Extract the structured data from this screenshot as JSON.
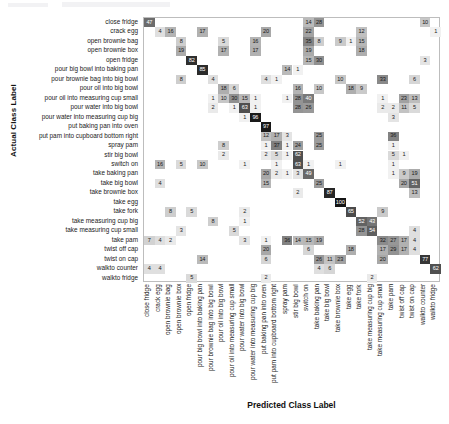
{
  "figure": {
    "x_axis_title": "Predicted Class Label",
    "y_axis_title": "Actual Class Label"
  },
  "chart_data": {
    "type": "heatmap",
    "subtype": "confusion-matrix",
    "title": "",
    "xlabel": "Predicted Class Label",
    "ylabel": "Actual Class Label",
    "grid": false,
    "legend": "none",
    "normalized": "percent",
    "value_range": [
      0,
      100
    ],
    "colormap": "greys",
    "categories": [
      "close fridge",
      "crack egg",
      "open brownie bag",
      "open brownie box",
      "open fridge",
      "pour big bowl into baking pan",
      "pour brownie bag into big bowl",
      "pour oil into big bowl",
      "pour oil into measuring cup small",
      "pour water into big bowl",
      "pour water into measuring cup big",
      "put baking pan into oven",
      "put pam into cupboard bottom right",
      "spray pam",
      "stir big bowl",
      "switch on",
      "take baking pan",
      "take big bowl",
      "take brownie box",
      "take egg",
      "take fork",
      "take measuring cup big",
      "take measuring cup small",
      "take pam",
      "twist off cap",
      "twist on cap",
      "walkto counter",
      "walkto fridge"
    ],
    "x_categories": [
      "close fridge",
      "crack egg",
      "open brownie bag",
      "open brownie box",
      "open fridge",
      "pour big bowl into baking pan",
      "pour brownie bag into big bowl",
      "pour oil into big bowl",
      "pour oil into measuring cup small",
      "pour water into big bowl",
      "pour water into measuring cup big",
      "put baking pan into oven",
      "put pam into cupboard bottom right",
      "spray pam",
      "stir big bowl",
      "switch on",
      "take baking pan",
      "take big bowl",
      "take brownie box",
      "take egg",
      "take fork",
      "take measuring cup big",
      "take measuring cup small",
      "take pam",
      "twist off cap",
      "twist on cap",
      "walkto counter",
      "walkto fridge"
    ],
    "cells": [
      {
        "r": 0,
        "c": 0,
        "v": 47
      },
      {
        "r": 0,
        "c": 15,
        "v": 14
      },
      {
        "r": 0,
        "c": 16,
        "v": 28
      },
      {
        "r": 0,
        "c": 26,
        "v": 10
      },
      {
        "r": 1,
        "c": 1,
        "v": 4
      },
      {
        "r": 1,
        "c": 2,
        "v": 16
      },
      {
        "r": 1,
        "c": 5,
        "v": 17
      },
      {
        "r": 1,
        "c": 11,
        "v": 20
      },
      {
        "r": 1,
        "c": 15,
        "v": 22
      },
      {
        "r": 1,
        "c": 20,
        "v": 12
      },
      {
        "r": 1,
        "c": 27,
        "v": 1
      },
      {
        "r": 2,
        "c": 3,
        "v": 8
      },
      {
        "r": 2,
        "c": 7,
        "v": 5
      },
      {
        "r": 2,
        "c": 10,
        "v": 16
      },
      {
        "r": 2,
        "c": 15,
        "v": 35
      },
      {
        "r": 2,
        "c": 16,
        "v": 8
      },
      {
        "r": 2,
        "c": 18,
        "v": 9
      },
      {
        "r": 2,
        "c": 19,
        "v": 1
      },
      {
        "r": 2,
        "c": 20,
        "v": 15
      },
      {
        "r": 3,
        "c": 3,
        "v": 19
      },
      {
        "r": 3,
        "c": 7,
        "v": 17
      },
      {
        "r": 3,
        "c": 10,
        "v": 17
      },
      {
        "r": 3,
        "c": 15,
        "v": 19
      },
      {
        "r": 3,
        "c": 20,
        "v": 18
      },
      {
        "r": 4,
        "c": 4,
        "v": 82
      },
      {
        "r": 4,
        "c": 15,
        "v": 15
      },
      {
        "r": 4,
        "c": 16,
        "v": 30
      },
      {
        "r": 4,
        "c": 26,
        "v": 3
      },
      {
        "r": 5,
        "c": 5,
        "v": 85
      },
      {
        "r": 5,
        "c": 13,
        "v": 14
      },
      {
        "r": 5,
        "c": 14,
        "v": 1
      },
      {
        "r": 6,
        "c": 3,
        "v": 8
      },
      {
        "r": 6,
        "c": 6,
        "v": 4
      },
      {
        "r": 6,
        "c": 11,
        "v": 4
      },
      {
        "r": 6,
        "c": 12,
        "v": 1
      },
      {
        "r": 6,
        "c": 18,
        "v": 10
      },
      {
        "r": 6,
        "c": 22,
        "v": 33
      },
      {
        "r": 6,
        "c": 25,
        "v": 6
      },
      {
        "r": 7,
        "c": 7,
        "v": 18
      },
      {
        "r": 7,
        "c": 8,
        "v": 6
      },
      {
        "r": 7,
        "c": 14,
        "v": 16
      },
      {
        "r": 7,
        "c": 16,
        "v": 10
      },
      {
        "r": 7,
        "c": 19,
        "v": 18
      },
      {
        "r": 7,
        "c": 20,
        "v": 9
      },
      {
        "r": 8,
        "c": 6,
        "v": 1
      },
      {
        "r": 8,
        "c": 7,
        "v": 10
      },
      {
        "r": 8,
        "c": 8,
        "v": 30
      },
      {
        "r": 8,
        "c": 9,
        "v": 15
      },
      {
        "r": 8,
        "c": 10,
        "v": 1
      },
      {
        "r": 8,
        "c": 13,
        "v": 1
      },
      {
        "r": 8,
        "c": 14,
        "v": 28
      },
      {
        "r": 8,
        "c": 15,
        "v": 40
      },
      {
        "r": 8,
        "c": 22,
        "v": 1
      },
      {
        "r": 8,
        "c": 24,
        "v": 23
      },
      {
        "r": 8,
        "c": 25,
        "v": 13
      },
      {
        "r": 9,
        "c": 6,
        "v": 2
      },
      {
        "r": 9,
        "c": 8,
        "v": 1
      },
      {
        "r": 9,
        "c": 9,
        "v": 63
      },
      {
        "r": 9,
        "c": 10,
        "v": 1
      },
      {
        "r": 9,
        "c": 14,
        "v": 28
      },
      {
        "r": 9,
        "c": 15,
        "v": 26
      },
      {
        "r": 9,
        "c": 22,
        "v": 2
      },
      {
        "r": 9,
        "c": 23,
        "v": 2
      },
      {
        "r": 9,
        "c": 24,
        "v": 11
      },
      {
        "r": 9,
        "c": 25,
        "v": 5
      },
      {
        "r": 10,
        "c": 9,
        "v": 1
      },
      {
        "r": 10,
        "c": 10,
        "v": 96
      },
      {
        "r": 10,
        "c": 23,
        "v": 3
      },
      {
        "r": 11,
        "c": 11,
        "v": 97
      },
      {
        "r": 12,
        "c": 11,
        "v": 12
      },
      {
        "r": 12,
        "c": 12,
        "v": 17
      },
      {
        "r": 12,
        "c": 13,
        "v": 3
      },
      {
        "r": 12,
        "c": 16,
        "v": 25
      },
      {
        "r": 12,
        "c": 23,
        "v": 36
      },
      {
        "r": 13,
        "c": 7,
        "v": 8
      },
      {
        "r": 13,
        "c": 11,
        "v": 1
      },
      {
        "r": 13,
        "c": 12,
        "v": 37
      },
      {
        "r": 13,
        "c": 13,
        "v": 1
      },
      {
        "r": 13,
        "c": 14,
        "v": 24
      },
      {
        "r": 13,
        "c": 16,
        "v": 25
      },
      {
        "r": 13,
        "c": 23,
        "v": 1
      },
      {
        "r": 14,
        "c": 7,
        "v": 2
      },
      {
        "r": 14,
        "c": 11,
        "v": 2
      },
      {
        "r": 14,
        "c": 12,
        "v": 5
      },
      {
        "r": 14,
        "c": 13,
        "v": 1
      },
      {
        "r": 14,
        "c": 14,
        "v": 62
      },
      {
        "r": 14,
        "c": 23,
        "v": 5
      },
      {
        "r": 14,
        "c": 24,
        "v": 1
      },
      {
        "r": 15,
        "c": 1,
        "v": 16
      },
      {
        "r": 15,
        "c": 3,
        "v": 5
      },
      {
        "r": 15,
        "c": 5,
        "v": 10
      },
      {
        "r": 15,
        "c": 9,
        "v": 1
      },
      {
        "r": 15,
        "c": 12,
        "v": 1
      },
      {
        "r": 15,
        "c": 14,
        "v": 63
      },
      {
        "r": 15,
        "c": 15,
        "v": 1
      },
      {
        "r": 15,
        "c": 18,
        "v": 1
      },
      {
        "r": 15,
        "c": 23,
        "v": 1
      },
      {
        "r": 16,
        "c": 11,
        "v": 20
      },
      {
        "r": 16,
        "c": 12,
        "v": 2
      },
      {
        "r": 16,
        "c": 13,
        "v": 1
      },
      {
        "r": 16,
        "c": 14,
        "v": 3
      },
      {
        "r": 16,
        "c": 15,
        "v": 49
      },
      {
        "r": 16,
        "c": 23,
        "v": 1
      },
      {
        "r": 16,
        "c": 24,
        "v": 9
      },
      {
        "r": 16,
        "c": 25,
        "v": 19
      },
      {
        "r": 17,
        "c": 1,
        "v": 4
      },
      {
        "r": 17,
        "c": 11,
        "v": 15
      },
      {
        "r": 17,
        "c": 16,
        "v": 25
      },
      {
        "r": 17,
        "c": 24,
        "v": 20
      },
      {
        "r": 17,
        "c": 25,
        "v": 51
      },
      {
        "r": 18,
        "c": 14,
        "v": 2
      },
      {
        "r": 18,
        "c": 17,
        "v": 87
      },
      {
        "r": 18,
        "c": 25,
        "v": 13
      },
      {
        "r": 19,
        "c": 18,
        "v": 100
      },
      {
        "r": 20,
        "c": 2,
        "v": 8
      },
      {
        "r": 20,
        "c": 4,
        "v": 5
      },
      {
        "r": 20,
        "c": 9,
        "v": 2
      },
      {
        "r": 20,
        "c": 19,
        "v": 65
      },
      {
        "r": 20,
        "c": 22,
        "v": 9
      },
      {
        "r": 21,
        "c": 6,
        "v": 8
      },
      {
        "r": 21,
        "c": 9,
        "v": 1
      },
      {
        "r": 21,
        "c": 20,
        "v": 52
      },
      {
        "r": 21,
        "c": 21,
        "v": 43
      },
      {
        "r": 22,
        "c": 3,
        "v": 3
      },
      {
        "r": 22,
        "c": 8,
        "v": 5
      },
      {
        "r": 22,
        "c": 20,
        "v": 28
      },
      {
        "r": 22,
        "c": 21,
        "v": 54
      },
      {
        "r": 22,
        "c": 25,
        "v": 4
      },
      {
        "r": 23,
        "c": 0,
        "v": 7
      },
      {
        "r": 23,
        "c": 1,
        "v": 4
      },
      {
        "r": 23,
        "c": 2,
        "v": 2
      },
      {
        "r": 23,
        "c": 9,
        "v": 3
      },
      {
        "r": 23,
        "c": 11,
        "v": 1
      },
      {
        "r": 23,
        "c": 13,
        "v": 36
      },
      {
        "r": 23,
        "c": 14,
        "v": 14
      },
      {
        "r": 23,
        "c": 15,
        "v": 15
      },
      {
        "r": 23,
        "c": 16,
        "v": 19
      },
      {
        "r": 23,
        "c": 22,
        "v": 32
      },
      {
        "r": 23,
        "c": 23,
        "v": 27
      },
      {
        "r": 23,
        "c": 24,
        "v": 17
      },
      {
        "r": 23,
        "c": 25,
        "v": 4
      },
      {
        "r": 24,
        "c": 11,
        "v": 20
      },
      {
        "r": 24,
        "c": 15,
        "v": 6
      },
      {
        "r": 24,
        "c": 19,
        "v": 18
      },
      {
        "r": 24,
        "c": 22,
        "v": 17
      },
      {
        "r": 24,
        "c": 23,
        "v": 29
      },
      {
        "r": 24,
        "c": 24,
        "v": 17
      },
      {
        "r": 24,
        "c": 25,
        "v": 4
      },
      {
        "r": 25,
        "c": 5,
        "v": 14
      },
      {
        "r": 25,
        "c": 11,
        "v": 6
      },
      {
        "r": 25,
        "c": 16,
        "v": 26
      },
      {
        "r": 25,
        "c": 17,
        "v": 11
      },
      {
        "r": 25,
        "c": 18,
        "v": 23
      },
      {
        "r": 25,
        "c": 22,
        "v": 20
      },
      {
        "r": 25,
        "c": 26,
        "v": 77
      },
      {
        "r": 26,
        "c": 0,
        "v": 4
      },
      {
        "r": 26,
        "c": 1,
        "v": 4
      },
      {
        "r": 26,
        "c": 16,
        "v": 4
      },
      {
        "r": 26,
        "c": 17,
        "v": 6
      },
      {
        "r": 26,
        "c": 27,
        "v": 62
      },
      {
        "r": 27,
        "c": 4,
        "v": 5
      },
      {
        "r": 27,
        "c": 11,
        "v": 2
      },
      {
        "r": 27,
        "c": 21,
        "v": 2
      }
    ]
  }
}
